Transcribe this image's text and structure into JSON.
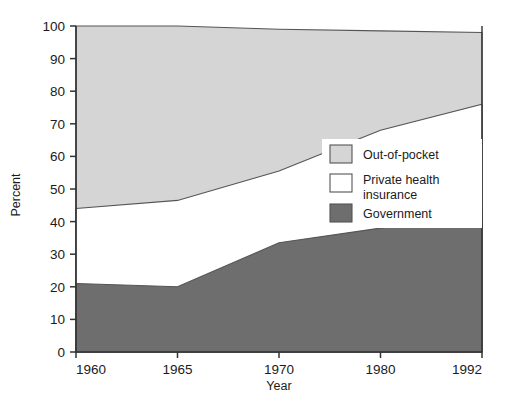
{
  "chart_data": {
    "type": "area",
    "title": "",
    "subtitle": "",
    "xlabel": "Year",
    "ylabel": "Percent",
    "categories": [
      "1960",
      "1965",
      "1970",
      "1980",
      "1992"
    ],
    "x": [
      1960,
      1965,
      1970,
      1980,
      1992
    ],
    "xtick_labels": [
      "1960",
      "1965",
      "1970",
      "1980",
      "1992"
    ],
    "ytick_labels": [
      "0",
      "10",
      "20",
      "30",
      "40",
      "50",
      "60",
      "70",
      "80",
      "90",
      "100"
    ],
    "yticks": [
      0,
      10,
      20,
      30,
      40,
      50,
      60,
      70,
      80,
      90,
      100
    ],
    "ylim": [
      0,
      100
    ],
    "grid": false,
    "stacked": true,
    "legend_position": "inside-right",
    "x_axis_spacing": "categorical",
    "series": [
      {
        "name": "Government",
        "values": [
          21,
          20,
          33.5,
          38,
          42.5
        ],
        "cumulative_top": [
          21,
          20,
          33.5,
          38,
          42.5
        ],
        "color": "#6e6e6e"
      },
      {
        "name": "Private health insurance",
        "values": [
          23,
          26.5,
          22,
          30,
          33.5
        ],
        "cumulative_top": [
          44,
          46.5,
          55.5,
          68,
          76
        ],
        "color": "#ffffff"
      },
      {
        "name": "Out-of-pocket",
        "values": [
          56,
          53.5,
          43.5,
          30.5,
          22
        ],
        "cumulative_top": [
          100,
          100,
          99,
          98.5,
          98
        ],
        "color": "#d5d5d5"
      }
    ]
  },
  "axes": {
    "y_title": "Percent",
    "x_title": "Year"
  },
  "legend": {
    "items": [
      {
        "label": "Out-of-pocket",
        "color": "#d5d5d5",
        "swatch": "swatch-out-of-pocket"
      },
      {
        "label": "Private health",
        "label2": "insurance",
        "color": "#ffffff",
        "swatch": "swatch-private-health-insurance"
      },
      {
        "label": "Government",
        "color": "#6e6e6e",
        "swatch": "swatch-government"
      }
    ]
  },
  "colors": {
    "out_of_pocket": "#d5d5d5",
    "private_health_insurance": "#ffffff",
    "government": "#6e6e6e",
    "axis": "#333333",
    "outline": "#555555",
    "text": "#1b1b1b"
  }
}
